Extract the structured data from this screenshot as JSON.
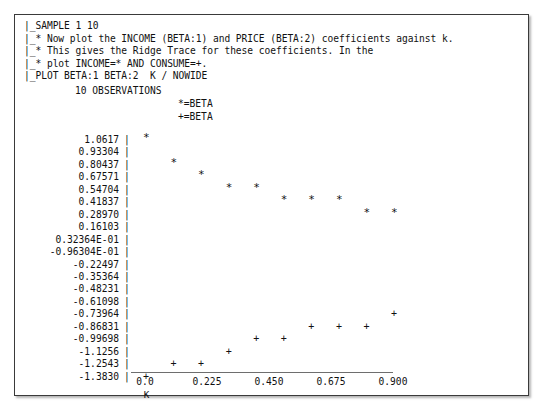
{
  "window": {
    "title": "Ridge Trace Plot Output"
  },
  "command_block": {
    "lines": [
      "|_SAMPLE 1 10",
      "|_* Now plot the INCOME (BETA:1) and PRICE (BETA:2) coefficients against k.",
      "|_* This gives the Ridge Trace for these coefficients. In the",
      "|_* plot INCOME=* AND CONSUME=+.",
      "|_PLOT BETA:1 BETA:2  K / NOWIDE"
    ]
  },
  "observations_line": "10 OBSERVATIONS",
  "legend": {
    "entries": [
      {
        "symbol": "*",
        "text": "*=BETA"
      },
      {
        "symbol": "+",
        "text": "+=BETA"
      }
    ]
  },
  "chart_data": {
    "type": "scatter",
    "xlabel": "K",
    "ylabel": "",
    "grid": false,
    "legend_position": "top-center",
    "xlim": [
      0.0,
      0.9
    ],
    "ylim": [
      -1.383,
      1.0617
    ],
    "xticks": [
      "0.0",
      "0.225",
      "0.450",
      "0.675",
      "0.900"
    ],
    "xtick_values": [
      0.0,
      0.225,
      0.45,
      0.675,
      0.9
    ],
    "yticks": [
      "1.0617",
      "0.93304",
      "0.80437",
      "0.67571",
      "0.54704",
      "0.41837",
      "0.28970",
      "0.16103",
      "0.32364E-01",
      "-0.96304E-01",
      "-0.22497",
      "-0.35364",
      "-0.48231",
      "-0.61098",
      "-0.73964",
      "-0.86831",
      "-0.99698",
      "-1.1256",
      "-1.2543",
      "-1.3830"
    ],
    "ytick_values": [
      1.0617,
      0.93304,
      0.80437,
      0.67571,
      0.54704,
      0.41837,
      0.2897,
      0.16103,
      0.032364,
      -0.096304,
      -0.22497,
      -0.35364,
      -0.48231,
      -0.61098,
      -0.73964,
      -0.86831,
      -0.99698,
      -1.1256,
      -1.2543,
      -1.383
    ],
    "series": [
      {
        "name": "*=BETA",
        "symbol": "*",
        "label": "BETA:1 (INCOME)",
        "x": [
          0.0,
          0.1,
          0.2,
          0.3,
          0.4,
          0.5,
          0.6,
          0.7,
          0.8,
          0.9
        ],
        "y": [
          1.0617,
          0.80437,
          0.67571,
          0.54704,
          0.54704,
          0.41837,
          0.41837,
          0.41837,
          0.2897,
          0.2897
        ]
      },
      {
        "name": "+=BETA",
        "symbol": "+",
        "label": "BETA:2 (PRICE)",
        "x": [
          0.0,
          0.1,
          0.2,
          0.3,
          0.4,
          0.5,
          0.6,
          0.7,
          0.8,
          0.9
        ],
        "y": [
          -1.383,
          -1.2543,
          -1.2543,
          -1.1256,
          -0.99698,
          -0.99698,
          -0.86831,
          -0.86831,
          -0.86831,
          -0.73964
        ]
      }
    ]
  }
}
